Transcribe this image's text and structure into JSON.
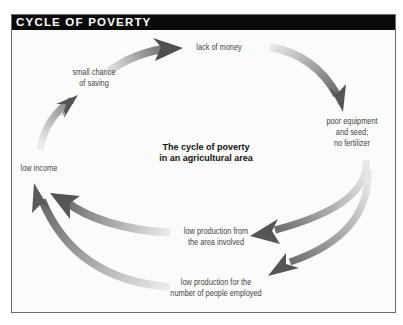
{
  "title": "CYCLE OF POVERTY",
  "center_caption": {
    "line1": "The cycle of poverty",
    "line2": "in an agricultural area"
  },
  "nodes": {
    "lack_of_money": {
      "line1": "lack of money"
    },
    "poor_equipment": {
      "line1": "poor equipment",
      "line2": "and seed;",
      "line3": "no fertilizer"
    },
    "low_production_area": {
      "line1": "low production from",
      "line2": "the area involved"
    },
    "low_production_people": {
      "line1": "low production for the",
      "line2": "number of people employed"
    },
    "low_income": {
      "line1": "low income"
    },
    "small_chance_saving": {
      "line1": "small chance",
      "line2": "of saving"
    }
  },
  "colors": {
    "title_bar": "#0a0a0a",
    "title_text": "#ffffff",
    "arrow_dark": "#5a5a5a",
    "arrow_light": "#e6e6e6",
    "background": "#fbfbfb",
    "border": "#6b6b6b"
  },
  "flow": [
    "low income",
    "small chance of saving",
    "lack of money",
    "poor equipment and seed; no fertilizer",
    "low production from the area involved",
    "low production for the number of people employed",
    "low income"
  ]
}
